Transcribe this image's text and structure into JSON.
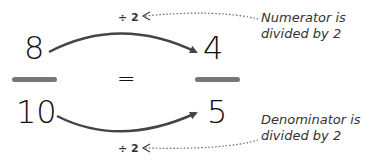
{
  "left_fraction": {
    "numerator": "8",
    "denominator": "10"
  },
  "right_fraction": {
    "numerator": "4",
    "denominator": "5"
  },
  "equals": "=",
  "top_operation": "÷ 2",
  "bottom_operation": "÷ 2",
  "top_note": {
    "line1": "Numerator is",
    "line2": "divided by 2"
  },
  "bottom_note": {
    "line1": "Denominator is",
    "line2": "divided by 2"
  },
  "colors": {
    "arrow": "#444444",
    "bar": "#777777",
    "dotted": "#666666"
  }
}
